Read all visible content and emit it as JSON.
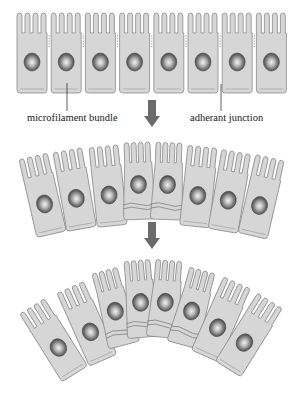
{
  "figure": {
    "stages": 3
  },
  "labels": {
    "microfilament_bundle": "microfilament bundle",
    "adherant_junction": "adherant junction"
  },
  "colors": {
    "cell_fill": "#d6d6d6",
    "cell_stroke": "#8a8a8a",
    "nucleus_dark": "#3c3c3c",
    "nucleus_light": "#e8e8e8",
    "arrow": "#6b6b6b",
    "text": "#1a1a1a"
  },
  "rows": [
    {
      "name": "flat-epithelium",
      "cells": 8,
      "arc": "none",
      "top_y": 13,
      "left_x": 15,
      "cell_width": 34.2,
      "constricted_cells": []
    },
    {
      "name": "initial-bending",
      "cells": 8,
      "arc": "slight",
      "top_y": 143,
      "constricted_cells": [
        3,
        4
      ]
    },
    {
      "name": "strong-bending",
      "cells": 8,
      "arc": "strong",
      "top_y": 260,
      "constricted_cells": [
        2,
        3,
        4,
        5
      ]
    }
  ],
  "arrows": [
    {
      "from": "flat-epithelium",
      "to": "initial-bending",
      "x": 152,
      "y": 100
    },
    {
      "from": "initial-bending",
      "to": "strong-bending",
      "x": 152,
      "y": 222
    }
  ]
}
